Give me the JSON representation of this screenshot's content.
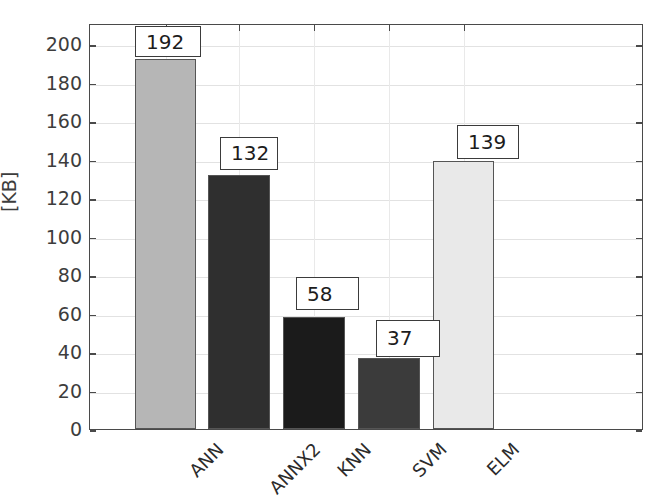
{
  "chart_data": {
    "type": "bar",
    "title": "",
    "subtitle": "",
    "xlabel": "",
    "ylabel": "[KB]",
    "categories": [
      "ANN",
      "ANNX2",
      "KNN",
      "SVM",
      "ELM"
    ],
    "values": [
      192,
      132,
      58,
      37,
      139
    ],
    "data_labels": [
      "192",
      "132",
      "58",
      "37",
      "139"
    ],
    "series": [
      {
        "name": "Model size",
        "values": [
          192,
          132,
          58,
          37,
          139
        ]
      }
    ],
    "bar_colors": [
      "#b6b6b6",
      "#2f2f2f",
      "#1b1b1b",
      "#3b3b3b",
      "#e9e9e9"
    ],
    "ylim": [
      0,
      209
    ],
    "yticks": [
      0,
      20,
      40,
      60,
      80,
      100,
      120,
      140,
      160,
      180,
      200
    ],
    "ytick_labels": [
      "0",
      "20",
      "40",
      "60",
      "80",
      "100",
      "120",
      "140",
      "160",
      "180",
      "200"
    ],
    "grid": true,
    "grid_axis": "both",
    "legend": false,
    "legend_position": "none",
    "xtick_rotation": -45,
    "axis_frame": "box",
    "background": "#ffffff",
    "axis_color": "#4a4a4a",
    "grid_color": "#e2e2e2",
    "label_box_border": "#3b3b3b",
    "label_box_fill": "#ffffff"
  },
  "axis": {
    "y_label": "[KB]"
  }
}
